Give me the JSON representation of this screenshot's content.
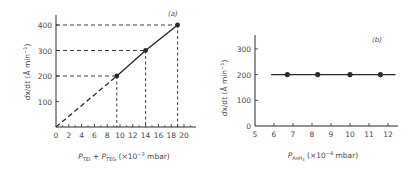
{
  "chart_data": [
    {
      "panel": "(a)",
      "type": "line",
      "xlabel": "P_TEI + P_TEG (×10⁻³ mbar)",
      "xlabel_parts": {
        "p1": "P",
        "s1": "TEI",
        "plus": " + ",
        "p2": "P",
        "s2": "TEG",
        "unit": " (×10",
        "exp": "−3",
        "unit2": " mbar)"
      },
      "ylabel": "dx/dt (Å min⁻¹)",
      "ylabel_parts": {
        "main": "dx/dt (Å min",
        "exp": "−1",
        "close": ")"
      },
      "xlim": [
        0,
        21.5
      ],
      "ylim": [
        0,
        450
      ],
      "xticks": [
        0,
        2,
        4,
        6,
        8,
        10,
        12,
        14,
        16,
        18,
        20
      ],
      "yticks": [
        100,
        200,
        300,
        400
      ],
      "grid": false,
      "series": [
        {
          "name": "measured",
          "x": [
            9.5,
            14,
            19
          ],
          "y": [
            200,
            300,
            400
          ],
          "style": "solid line with filled markers"
        },
        {
          "name": "extrapolation",
          "x": [
            0,
            9.5
          ],
          "y": [
            0,
            200
          ],
          "style": "dashed"
        }
      ],
      "guides": "dashed drop lines from each point to both axes"
    },
    {
      "panel": "(b)",
      "type": "line",
      "xlabel": "P_AsH3 (×10⁻⁴ mbar)",
      "xlabel_parts": {
        "p1": "P",
        "s1": "AsH",
        "s1b": "3",
        "unit": " (×10",
        "exp": "−4",
        "unit2": " mbar)"
      },
      "ylabel": "dx/dt (Å min⁻¹)",
      "ylabel_parts": {
        "main": "dx/dt (Å min",
        "exp": "−1",
        "close": ")"
      },
      "xlim": [
        5,
        12.5
      ],
      "ylim": [
        0,
        350
      ],
      "xticks": [
        5,
        6,
        7,
        8,
        9,
        10,
        11,
        12
      ],
      "yticks": [
        0,
        100,
        200,
        300
      ],
      "grid": false,
      "series": [
        {
          "name": "measured",
          "x": [
            6.7,
            8.3,
            10.0,
            11.6
          ],
          "y": [
            200,
            200,
            200,
            200
          ],
          "style": "horizontal solid line with filled markers",
          "line_extent": [
            5.85,
            12.4
          ]
        }
      ]
    }
  ],
  "colors": {
    "ink": "#2a2a2a",
    "text": "#4a4a4a"
  }
}
